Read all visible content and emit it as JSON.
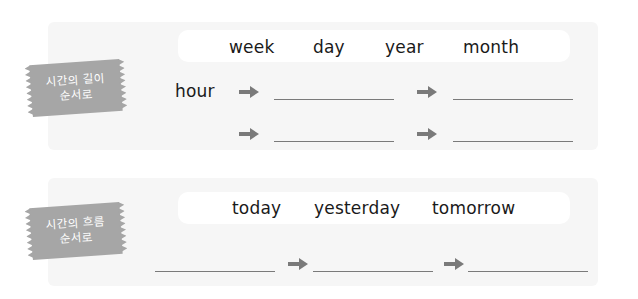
{
  "section1": {
    "tag_line1": "시간의 길이",
    "tag_line2": "순서로",
    "words": [
      "week",
      "day",
      "year",
      "month"
    ],
    "start_word": "hour",
    "rows": [
      {
        "blanks": [
          "",
          ""
        ]
      },
      {
        "blanks": [
          "",
          ""
        ]
      }
    ]
  },
  "section2": {
    "tag_line1": "시간의 흐름",
    "tag_line2": "순서로",
    "words": [
      "today",
      "yesterday",
      "tomorrow"
    ],
    "blanks": [
      "",
      "",
      ""
    ]
  },
  "icons": {
    "arrow": "right-arrow-icon"
  },
  "colors": {
    "tag": "#a6a6a6",
    "panel": "#f6f6f6",
    "arrow": "#7a7a7a",
    "line": "#7a7a7a"
  }
}
